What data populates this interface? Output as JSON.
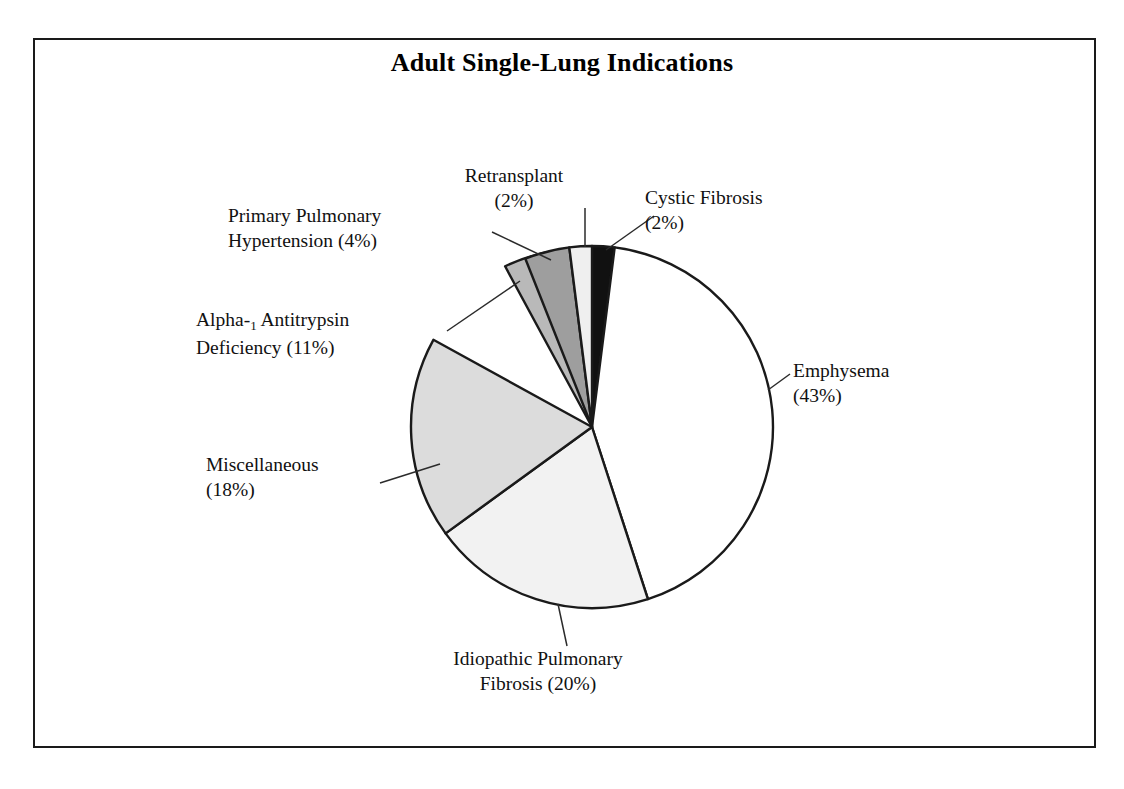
{
  "figure": {
    "title": "Adult Single-Lung Indications",
    "border_color": "#1a1a1a",
    "background": "#ffffff"
  },
  "chart_data": {
    "type": "pie",
    "title": "Adult Single-Lung Indications",
    "xlabel": "",
    "ylabel": "",
    "legend_position": "none",
    "labels_inline": true,
    "start_angle_deg": 0,
    "direction": "clockwise",
    "categories": [
      "Cystic Fibrosis",
      "Emphysema",
      "Idiopathic Pulmonary Fibrosis",
      "Miscellaneous",
      "Alpha-1 Antitrypsin Deficiency",
      "Primary Pulmonary Hypertension",
      "Retransplant"
    ],
    "values": [
      2,
      43,
      20,
      18,
      11,
      4,
      2
    ],
    "units": "percent",
    "slices": [
      {
        "name": "Cystic Fibrosis",
        "value": 2,
        "percent_text": "(2%)",
        "label_line1": "Cystic Fibrosis",
        "label_line2": "(2%)",
        "fill": "#111111",
        "start_deg": 0,
        "end_deg": 7.2
      },
      {
        "name": "Emphysema",
        "value": 43,
        "percent_text": "(43%)",
        "label_line1": "Emphysema",
        "label_line2": "(43%)",
        "fill": "#ffffff",
        "start_deg": 7.2,
        "end_deg": 162.0
      },
      {
        "name": "Idiopathic Pulmonary Fibrosis",
        "value": 20,
        "percent_text": "(20%)",
        "label_line1": "Idiopathic Pulmonary",
        "label_line2": "Fibrosis (20%)",
        "fill": "#f2f2f2",
        "start_deg": 162.0,
        "end_deg": 234.0
      },
      {
        "name": "Miscellaneous",
        "value": 18,
        "percent_text": "(18%)",
        "label_line1": "Miscellaneous",
        "label_line2": "(18%)",
        "fill": "#dcdcdc",
        "start_deg": 234.0,
        "end_deg": 298.8
      },
      {
        "name": "Alpha-1 Antitrypsin Deficiency",
        "value": 11,
        "percent_text": "(11%)",
        "label_line1_pre": "Alpha-",
        "label_line1_sub": "1",
        "label_line1_post": " Antitrypsin",
        "label_line2": "Deficiency (11%)",
        "fill": "#b9b9b9",
        "start_deg": 298.8,
        "end_deg": 338.4
      },
      {
        "name": "Primary Pulmonary Hypertension",
        "value": 4,
        "percent_text": "(4%)",
        "label_line1": "Primary Pulmonary",
        "label_line2": "Hypertension (4%)",
        "fill": "#9e9e9e",
        "start_deg": 338.4,
        "end_deg": 352.8
      },
      {
        "name": "Retransplant",
        "value": 2,
        "percent_text": "(2%)",
        "label_line1": "Retransplant",
        "label_line2": "(2%)",
        "fill": "#efefef",
        "start_deg": 352.8,
        "end_deg": 360.0
      }
    ],
    "geometry": {
      "center_x": 592,
      "center_y": 427,
      "radius": 181
    }
  }
}
